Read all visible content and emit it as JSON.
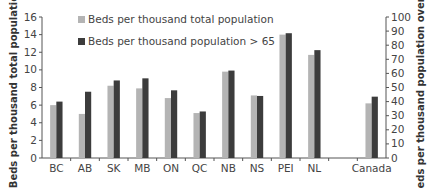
{
  "chart_data": {
    "type": "bar",
    "title": "",
    "categories": [
      "BC",
      "AB",
      "SK",
      "MB",
      "ON",
      "QC",
      "NB",
      "NS",
      "PEI",
      "NL",
      "",
      "Canada"
    ],
    "series": [
      {
        "name": "Beds per thousand total population",
        "axis": "left",
        "color": "#b4b4b4",
        "values": [
          6.0,
          5.0,
          8.2,
          7.9,
          6.8,
          5.1,
          9.8,
          7.1,
          14.0,
          11.7,
          null,
          6.2
        ]
      },
      {
        "name": "Beds per thousand population > 65",
        "axis": "right",
        "color": "#3c3c3c",
        "values": [
          40,
          47,
          55,
          56.5,
          48,
          33,
          62,
          44,
          88.5,
          76.5,
          null,
          43.5
        ]
      }
    ],
    "ylabel": "Beds per thousand total population",
    "ylim": [
      0,
      16
    ],
    "yticks": [
      0,
      2,
      4,
      6,
      8,
      10,
      12,
      14,
      16
    ],
    "y2label": "Beds per thousand population over 65",
    "y2lim": [
      0,
      100
    ],
    "y2ticks": [
      0,
      10,
      20,
      30,
      40,
      50,
      60,
      70,
      80,
      90,
      100
    ],
    "xlabel": "",
    "grid": false,
    "legend_position": "upper-left inside"
  },
  "legend": {
    "items": [
      {
        "label": "Beds per thousand total population",
        "color": "#b4b4b4"
      },
      {
        "label": "Beds per thousand population > 65",
        "color": "#3c3c3c"
      }
    ]
  }
}
